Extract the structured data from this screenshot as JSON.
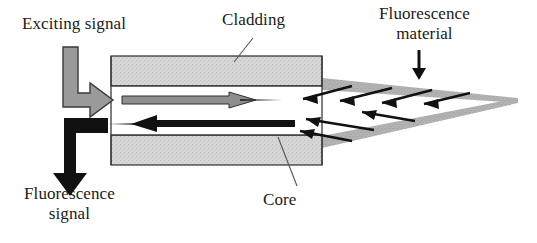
{
  "figure": {
    "type": "schematic-diagram",
    "background_color": "#ffffff"
  },
  "labels": {
    "exciting_signal": "Exciting signal",
    "cladding": "Cladding",
    "fluorescence_material": "Fluorescence\nmaterial",
    "fluorescence_signal": "Fluorescence\nsignal",
    "core": "Core"
  },
  "colors": {
    "cladding_fill": "#d4d4d4",
    "cladding_stroke": "#3a3a3a",
    "core_fill": "#ffffff",
    "wedge_fill": "#b0b0b0",
    "exciting_arrow": "#9a9a9a",
    "exciting_arrow_stroke": "#3a3a3a",
    "signal_arrow": "#111111",
    "ray_arrow": "#111111",
    "leader_line": "#555555",
    "text": "#1a1a1a"
  },
  "elements": {
    "cladding_top_band": {
      "x": 111,
      "y": 56,
      "width": 211,
      "height": 30
    },
    "cladding_bottom_band": {
      "x": 111,
      "y": 135,
      "width": 211,
      "height": 30
    },
    "core_region": {
      "x": 111,
      "y": 86,
      "width": 211,
      "height": 49
    },
    "fluorescence_wedge": {
      "shape": "hollow-triangle",
      "base_x": 322,
      "base_top_y": 78,
      "base_bottom_y": 148,
      "tip_x": 518,
      "tip_y": 100
    },
    "exciting_signal_arrow": {
      "shape": "elbow-down-then-right",
      "color": "#9a9a9a",
      "enters_at": "core left edge"
    },
    "fluorescence_signal_arrow": {
      "shape": "elbow-left-then-down",
      "color": "#111111",
      "exits_at": "core left edge downward"
    },
    "core_forward_ray": {
      "direction": "right",
      "color": "#9a9a9a",
      "description": "excitation light travelling into fiber"
    },
    "core_return_ray": {
      "direction": "left",
      "color": "#111111",
      "description": "fluorescence light travelling back out"
    },
    "wedge_rays": {
      "count": 7,
      "direction": "left",
      "color": "#111111",
      "description": "emitted fluorescence rays from the material back into the core"
    }
  },
  "leader_lines": {
    "cladding": {
      "from": [
        234,
        60
      ],
      "to": [
        252,
        40
      ]
    },
    "core": {
      "from": [
        278,
        137
      ],
      "to": [
        296,
        185
      ]
    },
    "fluorescence_material_arrow": {
      "x": 419,
      "from_y": 52,
      "to_y": 78
    }
  }
}
